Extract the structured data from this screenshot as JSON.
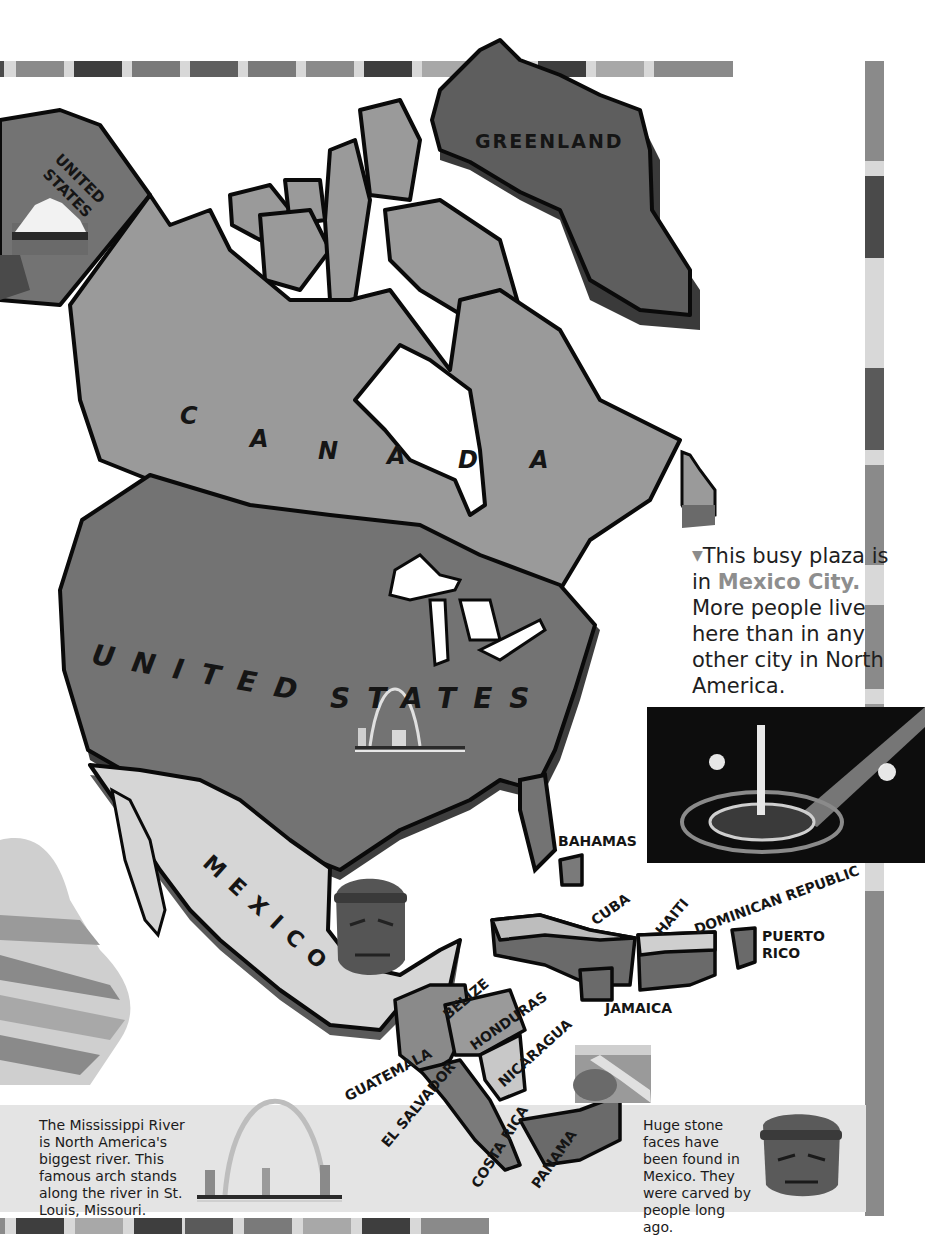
{
  "map": {
    "title": "North America",
    "countries": {
      "greenland": "GREENLAND",
      "alaska_line1": "UNITED",
      "alaska_line2": "STATES",
      "canada": [
        "C",
        "A",
        "N",
        "A",
        "D",
        "A"
      ],
      "usa_word1": "UNITED",
      "usa_word2": "STATES",
      "mexico": "MEXICO",
      "bahamas": "BAHAMAS",
      "cuba": "CUBA",
      "haiti": "HAITI",
      "dominican_republic": "DOMINICAN REPUBLIC",
      "puerto_rico_line1": "PUERTO",
      "puerto_rico_line2": "RICO",
      "jamaica": "JAMAICA",
      "belize": "BELIZE",
      "honduras": "HONDURAS",
      "guatemala": "GUATEMALA",
      "el_salvador": "EL SALVADOR",
      "nicaragua": "NICARAGUA",
      "costa_rica": "COSTA RICA",
      "panama": "PANAMA"
    },
    "colors": {
      "greenland": "#5e5e5e",
      "canada": "#9a9a9a",
      "usa": "#737373",
      "mexico": "#d6d6d6",
      "caribbean": "#7a7a7a",
      "outline": "#0a0a0a",
      "shadow": "#4a4a4a"
    }
  },
  "caption": {
    "marker": "▼",
    "line_prefix": "This busy plaza is in ",
    "highlight": "Mexico City.",
    "rest": "More people live here than in any other city in North America."
  },
  "notes": {
    "mississippi": "The Mississippi River is North America's biggest river. This famous arch stands along the river in St. Louis, Missouri.",
    "stone_faces": "Huge stone faces have been found in Mexico. They were carved by people long ago."
  },
  "icons": {
    "mountain": "mountain-landscape-icon",
    "arch": "gateway-arch-icon",
    "olmec_head": "olmec-head-icon",
    "river": "river-landscape-icon",
    "plaza_photo": "mexico-city-plaza-photo"
  },
  "frame": {
    "top": [
      "#4a4a4a",
      "#d0d0d0",
      "#8a8a8a",
      "#d8d8d8",
      "#3e3e3e",
      "#d8d8d8",
      "#7a7a7a",
      "#d8d8d8",
      "#6a6a6a",
      "#d8d8d8",
      "#555555",
      "#d8d8d8",
      "#3e3e3e",
      "#d8d8d8",
      "#a8a8a8",
      "#d8d8d8",
      "#8a8a8a"
    ],
    "right": [
      "#8a8a8a",
      "#d8d8d8",
      "#4a4a4a",
      "#d8d8d8",
      "#d8d8d8",
      "#5a5a5a",
      "#d8d8d8",
      "#8a8a8a",
      "#d8d8d8",
      "#9a9a9a",
      "#d8d8d8",
      "#d8d8d8",
      "#8a8a8a"
    ],
    "bottom": [
      "#8a8a8a",
      "#d8d8d8",
      "#3e3e3e",
      "#d8d8d8",
      "#a8a8a8",
      "#d8d8d8",
      "#3e3e3e",
      "#d8d8d8",
      "#5a5a5a",
      "#d8d8d8",
      "#7a7a7a",
      "#d8d8d8",
      "#a8a8a8",
      "#d8d8d8",
      "#3e3e3e",
      "#d8d8d8",
      "#8a8a8a"
    ]
  }
}
